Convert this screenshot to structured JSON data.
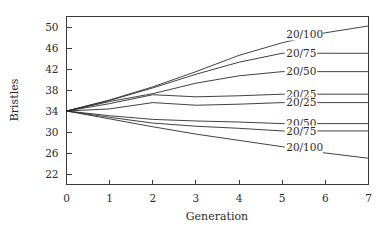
{
  "chart_data": {
    "type": "line",
    "title": "",
    "xlabel": "Generation",
    "ylabel": "Bristles",
    "xlim": [
      0,
      7
    ],
    "ylim": [
      20,
      52
    ],
    "grid": false,
    "legend_position": "inline-right-of-line-ends",
    "xticks": [
      0,
      1,
      2,
      3,
      4,
      5,
      6,
      7
    ],
    "xticklabels": [
      "0",
      "1",
      "2",
      "3",
      "4",
      "5",
      "6",
      "7"
    ],
    "yticks": [
      22,
      26,
      30,
      34,
      38,
      42,
      46,
      50
    ],
    "yticklabels": [
      "22",
      "26",
      "30",
      "34",
      "38",
      "42",
      "46",
      "50"
    ],
    "x": [
      0,
      1,
      2,
      3,
      4,
      5,
      6,
      7
    ],
    "series": [
      {
        "name": "20/100",
        "label": "20/100",
        "direction": "up",
        "label_x": 5.0,
        "label_y": 48.6,
        "values": [
          34.0,
          36.1,
          38.6,
          41.5,
          44.6,
          47.0,
          48.9,
          50.2
        ]
      },
      {
        "name": "20/75",
        "label": "20/75",
        "direction": "up",
        "label_x": 5.0,
        "label_y": 45.0,
        "values": [
          34.0,
          36.0,
          38.4,
          41.0,
          43.3,
          45.0,
          45.0,
          45.0
        ]
      },
      {
        "name": "20/50",
        "label": "20/50",
        "direction": "up",
        "label_x": 5.0,
        "label_y": 41.5,
        "values": [
          34.0,
          35.8,
          37.3,
          39.3,
          40.7,
          41.5,
          41.5,
          41.5
        ]
      },
      {
        "name": "20/25 (up)",
        "label": "20/25",
        "direction": "up",
        "label_x": 5.0,
        "label_y": 37.2,
        "values": [
          34.0,
          35.4,
          37.1,
          36.7,
          36.9,
          37.2,
          37.2,
          37.2
        ]
      },
      {
        "name": "20/25 (down)",
        "label": "20/25",
        "direction": "down",
        "label_x": 5.0,
        "label_y": 35.6,
        "values": [
          34.0,
          34.4,
          35.6,
          35.1,
          35.3,
          35.6,
          35.6,
          35.6
        ]
      },
      {
        "name": "20/50 (down)",
        "label": "20/50",
        "direction": "down",
        "label_x": 5.0,
        "label_y": 31.6,
        "values": [
          34.0,
          33.1,
          32.4,
          32.1,
          31.9,
          31.6,
          31.6,
          31.6
        ]
      },
      {
        "name": "20/75 (down)",
        "label": "20/75",
        "direction": "down",
        "label_x": 5.0,
        "label_y": 30.2,
        "values": [
          34.0,
          32.8,
          31.7,
          31.1,
          30.7,
          30.2,
          30.2,
          30.2
        ]
      },
      {
        "name": "20/100 (down)",
        "label": "20/100",
        "direction": "down",
        "label_x": 5.0,
        "label_y": 27.0,
        "values": [
          34.0,
          32.5,
          31.0,
          29.6,
          28.4,
          27.2,
          26.0,
          25.0
        ]
      }
    ],
    "colors": {
      "line": "#2b2b2b",
      "axis": "#3a3a3a",
      "text": "#2b2b2b",
      "background": "#ffffff"
    }
  }
}
